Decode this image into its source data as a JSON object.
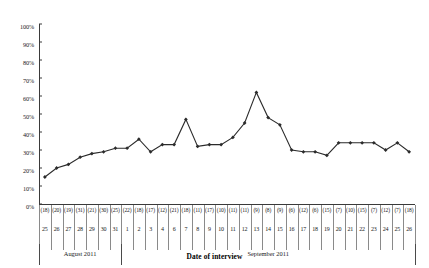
{
  "chart_data": {
    "type": "line",
    "title": "",
    "xlabel": "Date of interview",
    "ylabel": "",
    "ylim": [
      0,
      100
    ],
    "yticks": [
      0,
      10,
      20,
      30,
      40,
      50,
      60,
      70,
      80,
      90,
      100
    ],
    "ytick_labels": [
      "0%",
      "10%",
      "20%",
      "30%",
      "40%",
      "50%",
      "60%",
      "70%",
      "80%",
      "90%",
      "100%"
    ],
    "grid": false,
    "legend": null,
    "marker": "filled-diamond",
    "line_color": "#2b2b2b",
    "categories": [
      "25",
      "26",
      "27",
      "28",
      "29",
      "30",
      "31",
      "1",
      "2",
      "3",
      "4",
      "6",
      "7",
      "8",
      "9",
      "10",
      "11",
      "12",
      "13",
      "14",
      "15",
      "16",
      "17",
      "18",
      "19",
      "20",
      "21",
      "22",
      "23",
      "24",
      "25",
      "26"
    ],
    "counts": [
      "(18)",
      "(20)",
      "(19)",
      "(31)",
      "(21)",
      "(30)",
      "(25)",
      "(22)",
      "(18)",
      "(17)",
      "(12)",
      "(21)",
      "(18)",
      "(11)",
      "(17)",
      "(10)",
      "(11)",
      "(11)",
      "(9)",
      "(8)",
      "(9)",
      "(6)",
      "(12)",
      "(6)",
      "(15)",
      "(7)",
      "(10)",
      "(15)",
      "(7)",
      "(12)",
      "(7)",
      "(18)"
    ],
    "values": [
      15,
      20,
      22,
      26,
      28,
      29,
      31,
      31,
      36,
      29,
      33,
      33,
      47,
      32,
      33,
      33,
      37,
      45,
      62,
      48,
      44,
      30,
      29,
      29,
      27,
      34,
      34,
      34,
      34,
      30,
      34,
      29
    ],
    "month_bands": [
      {
        "label": "August 2011",
        "start_index": 0,
        "end_index": 6
      },
      {
        "label": "September 2011",
        "start_index": 7,
        "end_index": 31
      }
    ]
  }
}
